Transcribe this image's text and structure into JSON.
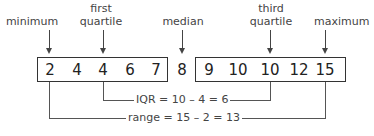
{
  "labels": {
    "minimum": "minimum",
    "first_quartile_line1": "first",
    "first_quartile_line2": "quartile",
    "median": "median",
    "third_quartile_line1": "third",
    "third_quartile_line2": "quartile",
    "maximum": "maximum"
  },
  "lower_half": [
    "2",
    "4",
    "4",
    "6",
    "7"
  ],
  "median_value": "8",
  "upper_half": [
    "9",
    "10",
    "10",
    "12",
    "15"
  ],
  "iqr_label": "IQR = 10 – 4 = 6",
  "range_label": "range = 15 – 2 = 13",
  "colors": {
    "stroke": "#333333",
    "text": "#444444",
    "background": "#ffffff"
  }
}
